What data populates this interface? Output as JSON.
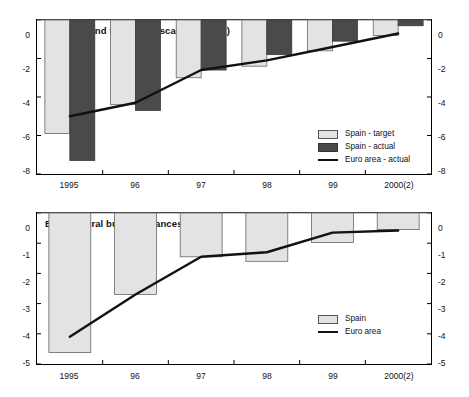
{
  "figure": {
    "background_color": "#ffffff",
    "panels": [
      "A",
      "B"
    ]
  },
  "colors": {
    "spain_target": "#e3e3e3",
    "spain_actual": "#4a4a4a",
    "euro_area_line": "#111111",
    "axis": "#000000",
    "text": "#111111"
  },
  "panel_a": {
    "title": "A. Actual and targetted fiscal deficits (1)",
    "legend": {
      "spain_target": "Spain - target",
      "spain_actual": "Spain - actual",
      "euro_area_actual": "Euro area - actual"
    },
    "y_ticks": [
      "0",
      "-2",
      "-4",
      "-6",
      "-8"
    ],
    "x_ticks": [
      "1995",
      "96",
      "97",
      "98",
      "99",
      "2000(2)"
    ]
  },
  "panel_b": {
    "title": "B. Structural budget balances",
    "legend": {
      "spain": "Spain",
      "euro_area": "Euro area"
    },
    "y_ticks": [
      "0",
      "-1",
      "-2",
      "-3",
      "-4",
      "-5"
    ],
    "x_ticks": [
      "1995",
      "96",
      "97",
      "98",
      "99",
      "2000(2)"
    ]
  },
  "chart_data": [
    {
      "type": "bar",
      "id": "panel-a",
      "title": "A. Actual and targetted fiscal deficits (1)",
      "xlabel": "",
      "ylabel": "",
      "categories": [
        "1995",
        "96",
        "97",
        "98",
        "99",
        "2000(2)"
      ],
      "ylim": [
        -8,
        0
      ],
      "ytick_values": [
        0,
        -2,
        -4,
        -6,
        -8
      ],
      "grid": false,
      "legend_position": "bottom-right",
      "series": [
        {
          "name": "Spain - target",
          "kind": "bar",
          "color": "#e3e3e3",
          "values": [
            -5.9,
            -4.4,
            -3.0,
            -2.4,
            -1.6,
            -0.8
          ]
        },
        {
          "name": "Spain - actual",
          "kind": "bar",
          "color": "#4a4a4a",
          "values": [
            -7.3,
            -4.7,
            -2.6,
            -1.8,
            -1.1,
            -0.3
          ]
        },
        {
          "name": "Euro area - actual",
          "kind": "line",
          "color": "#111111",
          "values": [
            -5.0,
            -4.3,
            -2.6,
            -2.1,
            -1.4,
            -0.7
          ]
        }
      ]
    },
    {
      "type": "bar",
      "id": "panel-b",
      "title": "B. Structural budget balances",
      "xlabel": "",
      "ylabel": "",
      "categories": [
        "1995",
        "96",
        "97",
        "98",
        "99",
        "2000(2)"
      ],
      "ylim": [
        -5,
        0
      ],
      "ytick_values": [
        0,
        -1,
        -2,
        -3,
        -4,
        -5
      ],
      "grid": false,
      "legend_position": "bottom-right",
      "series": [
        {
          "name": "Spain",
          "kind": "bar",
          "color": "#e3e3e3",
          "values": [
            -4.62,
            -2.7,
            -1.45,
            -1.6,
            -0.98,
            -0.55
          ]
        },
        {
          "name": "Euro area",
          "kind": "line",
          "color": "#111111",
          "values": [
            -4.1,
            -2.7,
            -1.45,
            -1.3,
            -0.65,
            -0.58
          ]
        }
      ]
    }
  ]
}
